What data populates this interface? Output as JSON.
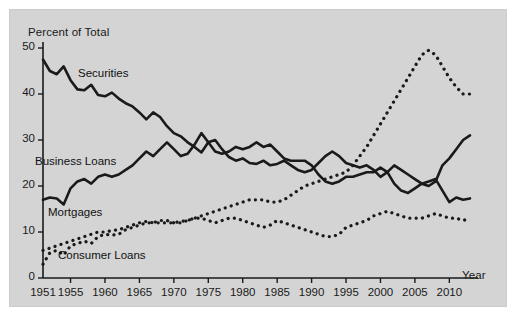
{
  "figure": {
    "background_color": "#ffffff",
    "panel_color": "#d4d4d4",
    "ink_color": "#1a1a1a"
  },
  "chart_data": {
    "type": "line",
    "title": "",
    "ylabel": "Percent of Total",
    "xlabel": "Year",
    "xlim": [
      1951,
      2013
    ],
    "ylim": [
      0,
      50
    ],
    "grid": false,
    "legend_position": "inline-annotations",
    "y_ticks": [
      0,
      10,
      20,
      30,
      40,
      50
    ],
    "x_ticks": [
      1951,
      1955,
      1960,
      1965,
      1970,
      1975,
      1980,
      1985,
      1990,
      1995,
      2000,
      2005,
      2010
    ],
    "x_tick_labels": [
      "1951",
      "1955",
      "1960",
      "1965",
      "1970",
      "1975",
      "1980",
      "1985",
      "1990",
      "1995",
      "2000",
      "2005",
      "2010"
    ],
    "y_tick_labels": [
      "0",
      "10",
      "20",
      "30",
      "40",
      "50"
    ],
    "x": [
      1951,
      1952,
      1953,
      1954,
      1955,
      1956,
      1957,
      1958,
      1959,
      1960,
      1961,
      1962,
      1963,
      1964,
      1965,
      1966,
      1967,
      1968,
      1969,
      1970,
      1971,
      1972,
      1973,
      1974,
      1975,
      1976,
      1977,
      1978,
      1979,
      1980,
      1981,
      1982,
      1983,
      1984,
      1985,
      1986,
      1987,
      1988,
      1989,
      1990,
      1991,
      1992,
      1993,
      1994,
      1995,
      1996,
      1997,
      1998,
      1999,
      2000,
      2001,
      2002,
      2003,
      2004,
      2005,
      2006,
      2007,
      2008,
      2009,
      2010,
      2011,
      2012,
      2013
    ],
    "series": [
      {
        "name": "Securities",
        "style": "solid",
        "label": "Securities",
        "values": [
          47.5,
          45.0,
          44.3,
          46.0,
          43.0,
          41.0,
          40.8,
          42.0,
          39.8,
          39.5,
          40.3,
          39.0,
          38.0,
          37.3,
          36.0,
          34.5,
          36.0,
          35.0,
          33.0,
          31.5,
          30.8,
          29.5,
          28.5,
          27.3,
          29.5,
          30.0,
          28.0,
          26.3,
          25.5,
          26.0,
          25.0,
          24.8,
          25.5,
          24.5,
          24.8,
          25.5,
          24.5,
          23.5,
          23.0,
          23.5,
          25.0,
          26.5,
          27.5,
          26.5,
          25.0,
          24.5,
          24.0,
          24.5,
          23.5,
          22.0,
          23.0,
          24.5,
          23.5,
          22.5,
          21.5,
          20.5,
          20.0,
          21.0,
          24.5,
          26.0,
          28.0,
          30.0,
          31.0
        ]
      },
      {
        "name": "Business Loans",
        "style": "solid",
        "label": "Business Loans",
        "values": [
          17.0,
          17.5,
          17.3,
          16.0,
          19.5,
          21.0,
          21.5,
          20.5,
          22.0,
          22.5,
          22.0,
          22.5,
          23.5,
          24.5,
          26.0,
          27.5,
          26.5,
          28.0,
          29.5,
          28.0,
          26.5,
          27.0,
          29.0,
          31.5,
          29.5,
          27.5,
          27.0,
          27.5,
          28.5,
          28.0,
          28.5,
          29.5,
          28.5,
          29.0,
          27.5,
          26.0,
          25.5,
          25.5,
          25.5,
          24.5,
          22.5,
          21.0,
          20.5,
          21.0,
          22.0,
          22.0,
          22.5,
          23.0,
          23.0,
          24.0,
          23.0,
          20.5,
          19.0,
          18.5,
          19.5,
          20.5,
          21.0,
          21.5,
          19.0,
          16.5,
          17.5,
          17.0,
          17.3
        ]
      },
      {
        "name": "Mortgages",
        "style": "dotted",
        "label": "Mortgages",
        "values": [
          6.0,
          6.5,
          7.0,
          7.5,
          8.0,
          8.5,
          9.0,
          9.5,
          10.0,
          10.0,
          10.3,
          10.5,
          11.0,
          11.5,
          12.0,
          12.3,
          12.0,
          12.0,
          12.0,
          12.0,
          12.3,
          12.5,
          13.0,
          13.5,
          14.0,
          14.5,
          15.0,
          15.5,
          16.0,
          16.5,
          17.0,
          17.0,
          17.0,
          16.5,
          16.5,
          17.0,
          18.0,
          19.0,
          20.0,
          20.5,
          21.0,
          21.5,
          22.0,
          22.5,
          23.0,
          24.5,
          26.5,
          28.5,
          31.0,
          33.5,
          36.0,
          38.5,
          41.0,
          43.5,
          46.0,
          48.5,
          49.5,
          48.5,
          46.0,
          43.5,
          41.5,
          40.0,
          40.0
        ]
      },
      {
        "name": "Consumer Loans",
        "style": "dotted",
        "label": "Consumer Loans",
        "values": [
          3.0,
          5.5,
          6.0,
          5.0,
          7.0,
          7.5,
          8.0,
          7.5,
          9.0,
          9.5,
          9.3,
          9.5,
          10.5,
          11.0,
          11.5,
          12.0,
          12.0,
          12.5,
          12.5,
          12.0,
          12.0,
          12.5,
          13.0,
          13.0,
          12.5,
          12.0,
          12.5,
          13.0,
          13.0,
          12.5,
          12.0,
          11.5,
          11.0,
          11.5,
          12.5,
          12.0,
          11.5,
          11.0,
          10.5,
          10.0,
          9.5,
          9.0,
          9.0,
          9.5,
          11.0,
          11.5,
          12.0,
          12.5,
          13.5,
          14.0,
          14.5,
          14.0,
          13.5,
          13.0,
          13.0,
          13.0,
          13.5,
          14.0,
          13.5,
          13.0,
          13.0,
          12.5,
          13.0
        ]
      }
    ]
  }
}
